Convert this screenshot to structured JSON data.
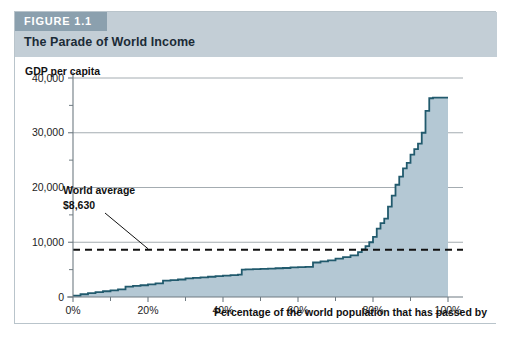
{
  "figure": {
    "tag": "FIGURE 1.1",
    "title": "The Parade of World Income"
  },
  "colors": {
    "header_band": "#c3ced6",
    "tag_box": "#8ba0ae",
    "area_fill": "#b4c8d4",
    "curve_line": "#215a6d",
    "grid_line": "#9aa3a8",
    "axis_line": "#6f7b82",
    "average_line": "#111111",
    "border": "#b9c4cb"
  },
  "chart_data": {
    "type": "line",
    "title": "The Parade of World Income",
    "xlabel": "Percentage of the world population that has passed by",
    "ylabel": "GDP per capita",
    "xlim": [
      0,
      100
    ],
    "ylim": [
      0,
      40000
    ],
    "xticks": [
      0,
      20,
      40,
      60,
      80,
      100
    ],
    "xticklabels": [
      "0%",
      "20%",
      "40%",
      "60%",
      "80%",
      "100%"
    ],
    "yticks": [
      0,
      10000,
      20000,
      30000,
      40000
    ],
    "yticklabels": [
      "0",
      "10,000",
      "20,000",
      "30,000",
      "40,000"
    ],
    "yminorticks": [
      5000,
      15000,
      25000,
      35000
    ],
    "grid": true,
    "legend": "none",
    "series": [
      {
        "name": "GDP per capita",
        "style": "step-area",
        "x": [
          0,
          2,
          4,
          6,
          8,
          10,
          12,
          14,
          16,
          18,
          20,
          22,
          24,
          26,
          28,
          30,
          32,
          34,
          36,
          38,
          40,
          42,
          44,
          45,
          46,
          48,
          50,
          52,
          54,
          56,
          58,
          60,
          62,
          64,
          66,
          68,
          70,
          72,
          74,
          76,
          77,
          78,
          79,
          80,
          81,
          82,
          83,
          84,
          85,
          86,
          87,
          88,
          89,
          90,
          91,
          92,
          93,
          94,
          95,
          96,
          98,
          100
        ],
        "y": [
          250,
          500,
          700,
          900,
          1050,
          1200,
          1400,
          1900,
          2050,
          2150,
          2300,
          2500,
          3000,
          3100,
          3200,
          3400,
          3500,
          3600,
          3700,
          3800,
          3900,
          4000,
          4100,
          5000,
          5050,
          5100,
          5150,
          5200,
          5250,
          5300,
          5400,
          5450,
          5500,
          6300,
          6500,
          6700,
          7000,
          7300,
          7600,
          8200,
          8700,
          9300,
          10000,
          11000,
          12500,
          13500,
          14300,
          16500,
          18500,
          20500,
          22000,
          23500,
          24500,
          26000,
          27000,
          28000,
          30000,
          34000,
          36300,
          36400,
          36400,
          36400
        ]
      }
    ],
    "annotations": [
      {
        "name": "world-average",
        "label_line1": "World average",
        "label_line2": "$8,630",
        "value": 8630,
        "style": "dashed-horizontal-line"
      }
    ]
  }
}
